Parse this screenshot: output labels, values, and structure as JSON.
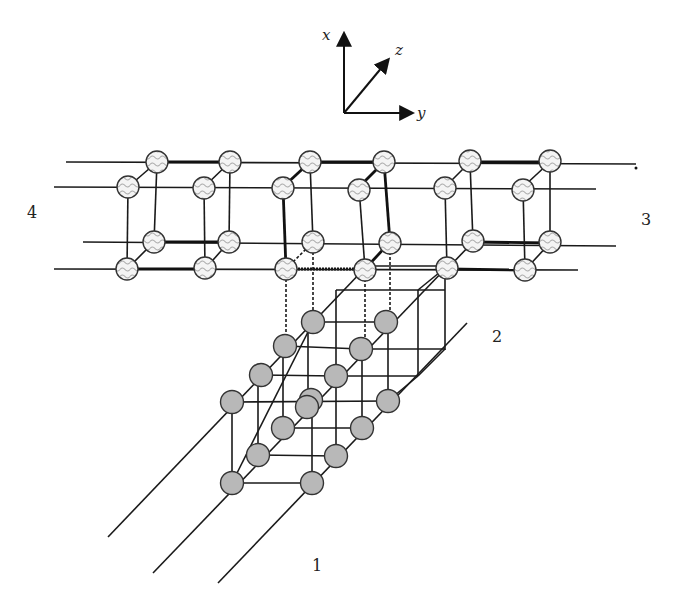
{
  "figure": {
    "axes": {
      "x_label": "x",
      "y_label": "y",
      "z_label": "z"
    },
    "region_labels": [
      {
        "id": "1",
        "text": "1"
      },
      {
        "id": "2",
        "text": "2"
      },
      {
        "id": "3",
        "text": "3"
      },
      {
        "id": "4",
        "text": "4"
      }
    ],
    "atom_types": [
      {
        "name": "wavy-hatched",
        "description": "upper lattice atoms (pattern fill)"
      },
      {
        "name": "gray-filled",
        "description": "lower lattice atoms (solid gray)"
      }
    ],
    "colors": {
      "line": "#1a1a1a",
      "gray_atom": "#b8b8b8",
      "hatch_stroke": "#aaaaaa",
      "background": "#ffffff"
    }
  }
}
